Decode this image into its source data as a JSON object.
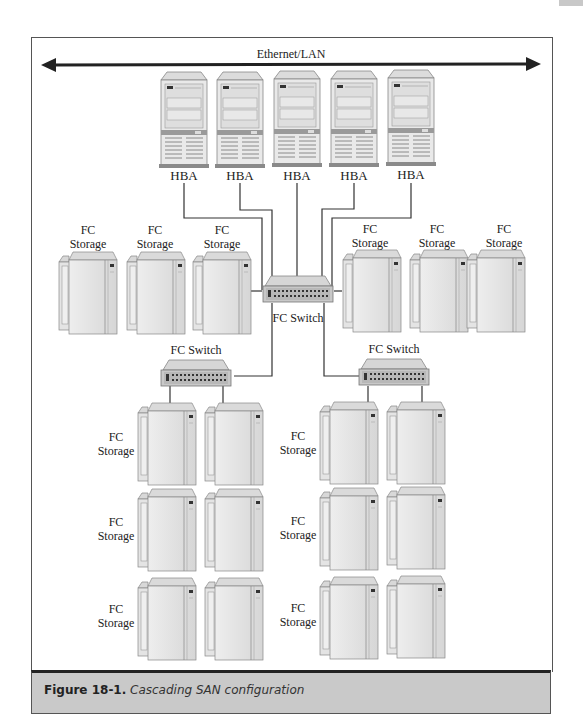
{
  "diagram": {
    "network_label": "Ethernet/LAN",
    "servers": [
      {
        "label": "HBA"
      },
      {
        "label": "HBA"
      },
      {
        "label": "HBA"
      },
      {
        "label": "HBA"
      },
      {
        "label": "HBA"
      }
    ],
    "core_switch": {
      "label": "FC Switch"
    },
    "left_switch": {
      "label": "FC Switch"
    },
    "right_switch": {
      "label": "FC Switch"
    },
    "storage_label_line1": "FC",
    "storage_label_line2": "Storage",
    "top_storage_count_left": 3,
    "top_storage_count_right": 3,
    "cascade_rows": 3
  },
  "caption": {
    "number": "Figure 18-1.",
    "text": "Cascading SAN configuration"
  }
}
